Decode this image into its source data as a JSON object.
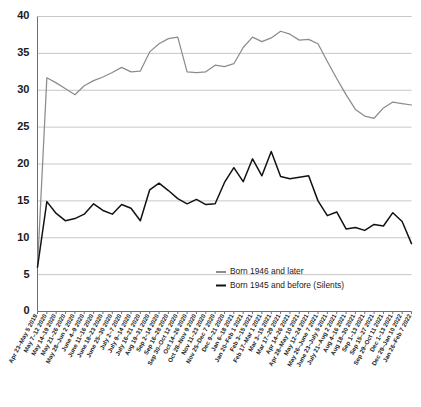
{
  "chart_data": {
    "type": "line",
    "title": "",
    "xlabel": "",
    "ylabel": "",
    "ylim": [
      0,
      40
    ],
    "ytick_step": 5,
    "yticks": [
      "0",
      "5",
      "10",
      "15",
      "20",
      "25",
      "30",
      "35",
      "40"
    ],
    "grid": true,
    "legend_position": "bottom-center",
    "categories": [
      "Apr 23–May 5 2019",
      "May 7–12 2020",
      "May 14–19 2020",
      "May 21–26 2020",
      "May 28–Jun 2 2020",
      "June 4–9 2020",
      "June 11–16 2020",
      "June 18–23 2020",
      "June 25–30 2020",
      "July 2–7 2020",
      "July 9–14 2020",
      "July 16–21 2020",
      "Aug 19–31 2020",
      "Sep 2–14 2020",
      "Sep 16–28 2020",
      "Sep 30–Oct 12 2020",
      "Oct 14–26 2020",
      "Oct 28–Nov 9 2020",
      "Nov 11–23 2020",
      "Nov 25–Dec 7 2020",
      "Dec 9–21 2020",
      "Jan 6–18 2021",
      "Jan 20–Feb 1 2021",
      "Feb 3–15 2021",
      "Feb 17–Mar 1 2021",
      "Mar 3–15 2021",
      "Mar 17–29 2021",
      "Apr 14–26 2021",
      "Apr 28–May 10 2021",
      "May 12–24 2021",
      "May 26–June 7 2021",
      "June 23–July 5 2021",
      "July 21–Aug 2 2021",
      "Aug 4–16 2021",
      "Aug 18–30 2021",
      "Sep 1–13 2021",
      "Sep 15–27 2021",
      "Sep 29–Oct 11 2021",
      "Dec 1–13 2021",
      "Dec 29–Jan 10 2022",
      "Jan 26–Feb 7 2022"
    ],
    "series": [
      {
        "name": "Born 1946 and later",
        "color": "#8c8c8c",
        "values": [
          6.0,
          31.7,
          31.0,
          30.2,
          29.4,
          30.6,
          31.3,
          31.8,
          32.4,
          33.1,
          32.5,
          32.6,
          35.2,
          36.3,
          37.0,
          37.2,
          32.5,
          32.4,
          32.5,
          33.4,
          33.2,
          33.6,
          35.8,
          37.2,
          36.6,
          37.1,
          38.0,
          37.6,
          36.8,
          36.9,
          36.3,
          33.9,
          31.6,
          29.4,
          27.4,
          26.5,
          26.2,
          27.6,
          28.4,
          28.2,
          28.0
        ]
      },
      {
        "name": "Born 1945 and before (Silents)",
        "color": "#121212",
        "values": [
          6.0,
          14.9,
          13.3,
          12.3,
          12.6,
          13.2,
          14.6,
          13.7,
          13.2,
          14.5,
          14.0,
          12.3,
          16.5,
          17.4,
          16.4,
          15.3,
          14.6,
          15.2,
          14.5,
          14.6,
          17.5,
          19.5,
          17.6,
          20.7,
          18.4,
          21.7,
          18.3,
          18.0,
          18.2,
          18.4,
          15.0,
          13.0,
          13.5,
          11.2,
          11.4,
          11.0,
          11.8,
          11.6,
          13.4,
          12.2,
          9.2
        ]
      }
    ],
    "legend": [
      {
        "label": "Born 1946 and later",
        "color": "#8c8c8c"
      },
      {
        "label": "Born 1945 and before (Silents)",
        "color": "#121212"
      }
    ]
  }
}
